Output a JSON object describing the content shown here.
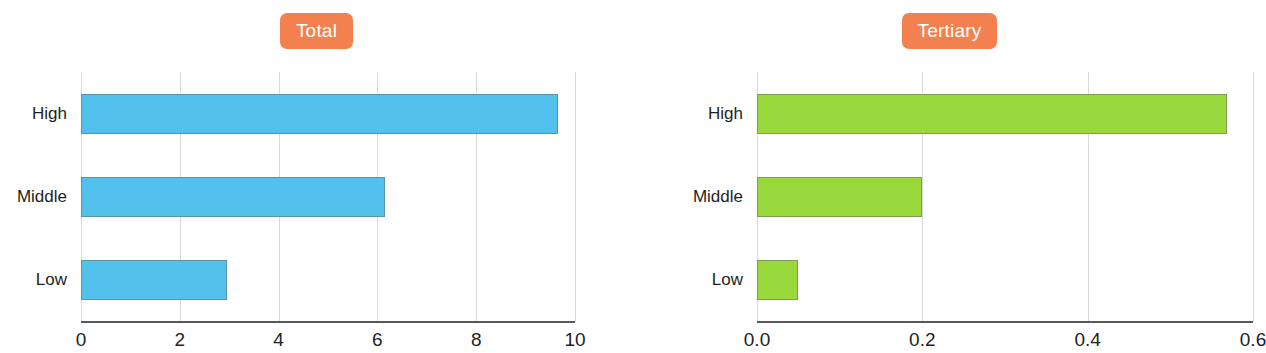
{
  "figure": {
    "background": "#ffffff",
    "badge_color": "#f2814f",
    "badge_text_color": "#ffffff",
    "axis_color": "#595959",
    "grid_color": "#d9d9d9"
  },
  "panels": [
    {
      "title": "Total",
      "bar_color": "#52c1ec",
      "categories": [
        "High",
        "Middle",
        "Low"
      ],
      "values": [
        9.65,
        6.15,
        2.95
      ],
      "ticks": [
        "0",
        "2",
        "4",
        "6",
        "8",
        "10"
      ],
      "tick_values": [
        0,
        2,
        4,
        6,
        8,
        10
      ],
      "xmin": 0,
      "xmax": 10
    },
    {
      "title": "Tertiary",
      "bar_color": "#9ad93c",
      "categories": [
        "High",
        "Middle",
        "Low"
      ],
      "values": [
        0.568,
        0.2,
        0.05
      ],
      "ticks": [
        "0.0",
        "0.2",
        "0.4",
        "0.6"
      ],
      "tick_values": [
        0,
        0.2,
        0.4,
        0.6
      ],
      "xmin": 0,
      "xmax": 0.6
    }
  ],
  "chart_data": {
    "type": "bar",
    "orientation": "horizontal",
    "title": "",
    "grid": "vertical-only",
    "legend": "none",
    "panels": [
      {
        "title": "Total",
        "categories": [
          "High",
          "Middle",
          "Low"
        ],
        "values": [
          9.65,
          6.15,
          2.95
        ],
        "color": "#52c1ec",
        "xlabel": "",
        "ylabel": "",
        "xlim": [
          0,
          10
        ],
        "xticks": [
          0,
          2,
          4,
          6,
          8,
          10
        ],
        "xticklabels": [
          "0",
          "2",
          "4",
          "6",
          "8",
          "10"
        ]
      },
      {
        "title": "Tertiary",
        "categories": [
          "High",
          "Middle",
          "Low"
        ],
        "values": [
          0.568,
          0.2,
          0.05
        ],
        "color": "#9ad93c",
        "xlabel": "",
        "ylabel": "",
        "xlim": [
          0,
          0.6
        ],
        "xticks": [
          0.0,
          0.2,
          0.4,
          0.6
        ],
        "xticklabels": [
          "0.0",
          "0.2",
          "0.4",
          "0.6"
        ]
      }
    ]
  }
}
